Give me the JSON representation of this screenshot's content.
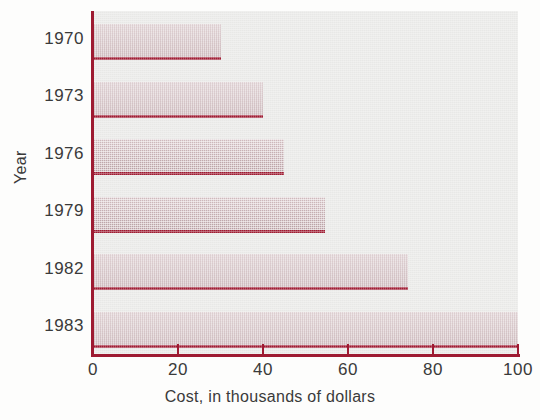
{
  "chart_data": {
    "type": "bar",
    "orientation": "horizontal",
    "title": "",
    "subtitle": "",
    "xlabel": "Cost, in thousands of dollars",
    "ylabel": "Year",
    "categories": [
      "1970",
      "1973",
      "1976",
      "1979",
      "1982",
      "1983"
    ],
    "values": [
      30,
      40,
      45,
      54.5,
      74,
      100
    ],
    "xlim": [
      0,
      100
    ],
    "x_ticks": [
      0,
      20,
      40,
      60,
      80,
      100
    ],
    "x_tick_labels": [
      "0",
      "20",
      "40",
      "60",
      "80",
      "100"
    ],
    "grid": false,
    "legend": null,
    "legend_position": "none",
    "annotations": [],
    "series": [
      {
        "name": "Cost",
        "values": [
          30,
          40,
          45,
          54.5,
          74,
          100
        ]
      }
    ]
  },
  "style": {
    "plot_background": "#e8e8e6",
    "bar_fill": "#c3a8ac",
    "bar_baseline": "#9e1b32",
    "axis_color": "#9e1b32",
    "text_color": "#3a3a3a",
    "page_background": "#fdfdfc"
  }
}
